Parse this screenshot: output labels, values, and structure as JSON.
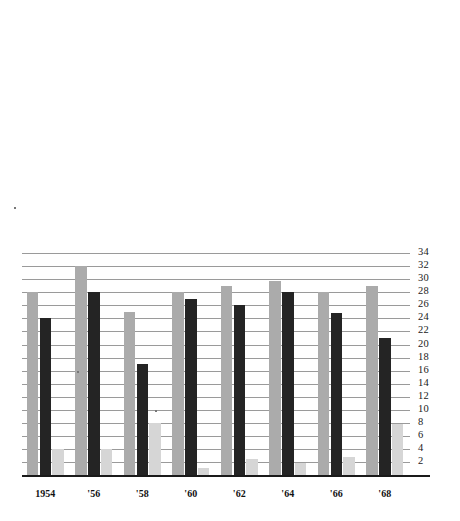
{
  "chart_data": {
    "type": "bar",
    "title": "",
    "subtitle": "",
    "xlabel": "",
    "ylabel": "",
    "categories": [
      "1954",
      "'56",
      "'58",
      "'60",
      "'62",
      "'64",
      "'66",
      "'68"
    ],
    "ytick_labels": [
      "34",
      "32",
      "30",
      "28",
      "26",
      "24",
      "22",
      "20",
      "18",
      "16",
      "14",
      "12",
      "10",
      "8",
      "6",
      "4",
      "2"
    ],
    "ytick_values": [
      34,
      32,
      30,
      28,
      26,
      24,
      22,
      20,
      18,
      16,
      14,
      12,
      10,
      8,
      6,
      4,
      2
    ],
    "ylim": [
      0,
      35
    ],
    "grid": true,
    "legend": "none",
    "series": [
      {
        "name": "series-1",
        "color": "#ababab",
        "values": [
          28,
          32,
          25,
          28,
          29,
          29.8,
          28,
          29
        ]
      },
      {
        "name": "series-2",
        "color": "#242424",
        "values": [
          24,
          28,
          17,
          27,
          26,
          28,
          24.8,
          21
        ]
      },
      {
        "name": "series-3",
        "color": "#d6d6d6",
        "values": [
          4,
          4,
          8,
          1,
          2.5,
          1.8,
          2.8,
          7.8
        ]
      }
    ]
  },
  "colors": {
    "series1": "#ababab",
    "series2": "#242424",
    "series3": "#d6d6d6",
    "gridline": "#9a9a9a",
    "axis": "#1a1a1a",
    "background": "#ffffff"
  }
}
